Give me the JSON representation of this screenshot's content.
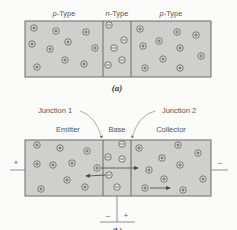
{
  "figure_a": {
    "labels": [
      {
        "text": "p-Type",
        "x": 64,
        "y": 16
      },
      {
        "text": "n-Type",
        "x": 117,
        "y": 16
      },
      {
        "text": "p-Type",
        "x": 171,
        "y": 16
      }
    ],
    "caption": "(a)",
    "box": {
      "x": 25,
      "y": 21,
      "w": 186,
      "h": 56
    },
    "dividers": [
      103,
      131
    ],
    "holes": [
      [
        34,
        28
      ],
      [
        56,
        31
      ],
      [
        86,
        32
      ],
      [
        32,
        44
      ],
      [
        50,
        49
      ],
      [
        68,
        42
      ],
      [
        95,
        48
      ],
      [
        65,
        60
      ],
      [
        84,
        64
      ],
      [
        37,
        67
      ],
      [
        140,
        29
      ],
      [
        177,
        32
      ],
      [
        196,
        35
      ],
      [
        143,
        46
      ],
      [
        159,
        41
      ],
      [
        180,
        48
      ],
      [
        163,
        59
      ],
      [
        201,
        56
      ],
      [
        145,
        68
      ],
      [
        180,
        68
      ]
    ],
    "electrons": [
      [
        109,
        25
      ],
      [
        124,
        40
      ],
      [
        114,
        48
      ],
      [
        108,
        65
      ],
      [
        122,
        60
      ]
    ]
  },
  "figure_b": {
    "annotations": [
      {
        "text": "Junction 1",
        "x": 43,
        "y": 113
      },
      {
        "text": "Junction 2",
        "x": 179,
        "y": 113
      }
    ],
    "region_labels": [
      {
        "text": "Emitter",
        "x": 68,
        "y": 132
      },
      {
        "text": "Base",
        "x": 117,
        "y": 132
      },
      {
        "text": "Collector",
        "x": 171,
        "y": 132
      }
    ],
    "terminal_signs": {
      "left": "+",
      "right": "–",
      "base_minus": "–",
      "base_plus": "+"
    },
    "caption": "(b)",
    "box": {
      "x": 25,
      "y": 140,
      "w": 186,
      "h": 56
    },
    "dividers": [
      103,
      131
    ],
    "holes": [
      [
        37,
        145
      ],
      [
        60,
        148
      ],
      [
        87,
        151
      ],
      [
        37,
        164
      ],
      [
        53,
        165
      ],
      [
        72,
        163
      ],
      [
        97,
        168
      ],
      [
        67,
        180
      ],
      [
        85,
        187
      ],
      [
        41,
        189
      ],
      [
        139,
        148
      ],
      [
        178,
        145
      ],
      [
        198,
        153
      ],
      [
        162,
        158
      ],
      [
        180,
        165
      ],
      [
        149,
        170
      ],
      [
        164,
        179
      ],
      [
        203,
        179
      ],
      [
        145,
        188
      ],
      [
        183,
        190
      ]
    ],
    "electrons": [
      [
        122,
        144
      ],
      [
        108,
        157
      ],
      [
        122,
        159
      ],
      [
        109,
        175
      ],
      [
        117,
        187
      ]
    ],
    "arrows": [
      {
        "from": [
          101,
          168
        ],
        "to": [
          138,
          168
        ]
      },
      {
        "from": [
          106,
          175
        ],
        "to": [
          86,
          176
        ]
      },
      {
        "from": [
          150,
          188
        ],
        "to": [
          170,
          188
        ]
      }
    ]
  }
}
